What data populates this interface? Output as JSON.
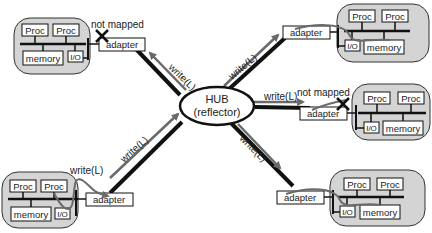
{
  "hub": {
    "line1": "HUB",
    "line2": "(reflector)"
  },
  "labels": {
    "proc": "Proc",
    "memory": "memory",
    "io": "I/O",
    "adapter": "adapter",
    "write": "write(L)",
    "not_mapped": "not mapped"
  },
  "nodes": [
    {
      "id": "top-left",
      "status": "not mapped"
    },
    {
      "id": "top-right",
      "status": "mapped"
    },
    {
      "id": "mid-right",
      "status": "not mapped"
    },
    {
      "id": "bottom-left",
      "status": "source"
    },
    {
      "id": "bottom-right",
      "status": "mapped"
    }
  ],
  "colors": {
    "node_fill": "#d4d4d4",
    "line": "#111111",
    "arrow": "#6a6a6a"
  }
}
